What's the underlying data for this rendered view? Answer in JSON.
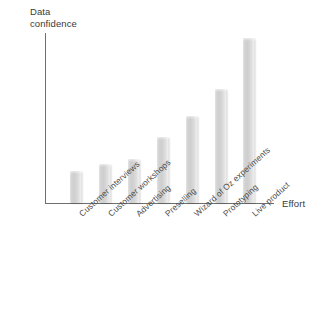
{
  "chart_data": {
    "type": "bar",
    "title": "",
    "subtitle": "",
    "xlabel": "Effort",
    "ylabel": "Data confidence",
    "ylabel_lines": "Data\nconfidence",
    "categories": [
      "Customer interviews",
      "Customer workshops",
      "Advertising",
      "Preselling",
      "Wizard of Oz experiments",
      "Prototyping",
      "Live product"
    ],
    "values": [
      19,
      23,
      26,
      39,
      51,
      67,
      97
    ],
    "series": [
      {
        "name": "Data confidence",
        "values": [
          19,
          23,
          26,
          39,
          51,
          67,
          97
        ]
      }
    ],
    "ylim": [
      0,
      100
    ],
    "xlim": [
      0,
      8
    ],
    "grid": false,
    "legend": false,
    "legend_position": "none",
    "axis_ticks": false,
    "tick_labels_y": [],
    "tick_labels_x": [
      "Customer interviews",
      "Customer workshops",
      "Advertising",
      "Preselling",
      "Wizard of Oz experiments",
      "Prototyping",
      "Live product"
    ],
    "annotations": [],
    "bar_color": "#d4d4d4",
    "axis_color": "#6e6e6e",
    "text_color": "#3a3a3a",
    "background_color": "#ffffff",
    "x_label_rotation": -42
  },
  "axes": {
    "y_title": "Data\nconfidence",
    "x_title": "Effort"
  }
}
